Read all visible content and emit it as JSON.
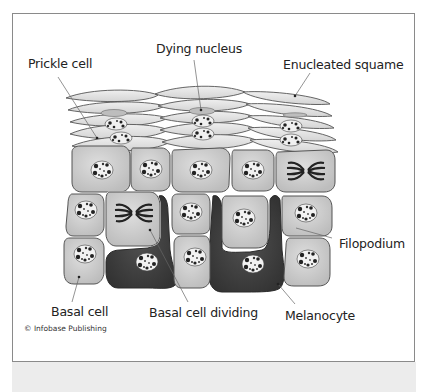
{
  "figure": {
    "labels": {
      "prickle_cell": "Prickle cell",
      "dying_nucleus": "Dying nucleus",
      "enucleated_squame": "Enucleated squame",
      "filopodium": "Filopodium",
      "basal_cell": "Basal cell",
      "basal_cell_dividing": "Basal cell dividing",
      "melanocyte": "Melanocyte"
    },
    "credit": "© Infobase Publishing",
    "colors": {
      "cell_fill": "#c9c9c9",
      "cell_stroke": "#555555",
      "melanocyte_fill": "#3e3e3e",
      "squame_fill": "#e2e2e2",
      "frame_border": "#8a8a8a",
      "band": "#ececec"
    }
  }
}
